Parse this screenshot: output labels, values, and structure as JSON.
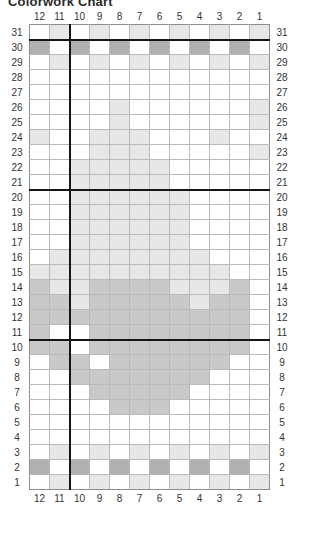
{
  "title": "Colorwork Chart",
  "legend_note": "",
  "colors": {
    "blank": "#ffffff",
    "light": "#e7e7e7",
    "mid": "#c9c9c9",
    "dark": "#b0b0b0",
    "grid": "#b9b9b9",
    "heavy": "#151515"
  },
  "chart_data": {
    "type": "heatmap",
    "title": "Colorwork Chart",
    "xlabel": "",
    "ylabel": "",
    "grid": true,
    "legend_position": "none",
    "columns": 12,
    "rows": 31,
    "column_labels_top": [
      "12",
      "11",
      "10",
      "9",
      "8",
      "7",
      "6",
      "5",
      "4",
      "3",
      "2",
      "1"
    ],
    "column_labels_bottom": [
      "12",
      "11",
      "10",
      "9",
      "8",
      "7",
      "6",
      "5",
      "4",
      "3",
      "2",
      "1"
    ],
    "row_labels_left": [
      "31",
      "30",
      "29",
      "28",
      "27",
      "26",
      "25",
      "24",
      "23",
      "22",
      "21",
      "20",
      "19",
      "18",
      "17",
      "16",
      "15",
      "14",
      "13",
      "12",
      "11",
      "10",
      "9",
      "8",
      "7",
      "6",
      "5",
      "4",
      "3",
      "2",
      "1"
    ],
    "row_labels_right": [
      "31",
      "30",
      "29",
      "28",
      "27",
      "26",
      "25",
      "24",
      "23",
      "22",
      "21",
      "20",
      "19",
      "18",
      "17",
      "16",
      "15",
      "14",
      "13",
      "12",
      "11",
      "10",
      "9",
      "8",
      "7",
      "6",
      "5",
      "4",
      "3",
      "2",
      "1"
    ],
    "value_legend": {
      "0": "blank",
      "1": "light",
      "2": "mid",
      "3": "dark"
    },
    "heavy_vertical_after_column_index": 2,
    "heavy_horizontal_after_rows": [
      "31",
      "21",
      "11"
    ],
    "matrix": [
      [
        0,
        1,
        0,
        1,
        0,
        1,
        0,
        1,
        0,
        1,
        0,
        1
      ],
      [
        3,
        0,
        3,
        0,
        3,
        0,
        3,
        0,
        3,
        0,
        3,
        0
      ],
      [
        0,
        1,
        0,
        1,
        0,
        1,
        0,
        1,
        0,
        1,
        0,
        1
      ],
      [
        0,
        0,
        0,
        0,
        0,
        0,
        0,
        0,
        0,
        0,
        0,
        0
      ],
      [
        0,
        0,
        0,
        0,
        0,
        0,
        0,
        0,
        0,
        0,
        0,
        0
      ],
      [
        0,
        0,
        0,
        0,
        1,
        0,
        0,
        0,
        0,
        0,
        0,
        1
      ],
      [
        0,
        0,
        0,
        0,
        1,
        0,
        0,
        0,
        0,
        0,
        0,
        1
      ],
      [
        1,
        0,
        0,
        1,
        1,
        1,
        0,
        0,
        0,
        1,
        0,
        0
      ],
      [
        0,
        0,
        0,
        1,
        1,
        1,
        0,
        0,
        0,
        0,
        0,
        1
      ],
      [
        0,
        0,
        1,
        1,
        1,
        1,
        1,
        0,
        0,
        0,
        0,
        0
      ],
      [
        0,
        0,
        1,
        1,
        1,
        1,
        1,
        0,
        0,
        0,
        0,
        0
      ],
      [
        0,
        0,
        1,
        1,
        1,
        1,
        1,
        1,
        0,
        0,
        0,
        0
      ],
      [
        0,
        0,
        1,
        1,
        1,
        1,
        1,
        1,
        0,
        0,
        0,
        0
      ],
      [
        0,
        0,
        1,
        1,
        1,
        1,
        1,
        1,
        0,
        0,
        0,
        0
      ],
      [
        0,
        0,
        1,
        1,
        1,
        1,
        1,
        1,
        0,
        0,
        0,
        0
      ],
      [
        0,
        1,
        1,
        1,
        1,
        1,
        1,
        1,
        1,
        0,
        0,
        0
      ],
      [
        1,
        1,
        1,
        1,
        1,
        1,
        1,
        1,
        1,
        1,
        0,
        0
      ],
      [
        2,
        1,
        1,
        2,
        2,
        2,
        2,
        1,
        1,
        1,
        2,
        0
      ],
      [
        2,
        2,
        1,
        2,
        2,
        2,
        2,
        2,
        1,
        2,
        2,
        0
      ],
      [
        2,
        2,
        2,
        2,
        2,
        2,
        2,
        2,
        2,
        2,
        2,
        0
      ],
      [
        2,
        0,
        0,
        2,
        2,
        2,
        2,
        2,
        2,
        2,
        2,
        0
      ],
      [
        2,
        2,
        0,
        2,
        2,
        2,
        2,
        2,
        2,
        2,
        2,
        0
      ],
      [
        0,
        2,
        2,
        0,
        2,
        2,
        2,
        2,
        2,
        2,
        0,
        0
      ],
      [
        0,
        0,
        2,
        2,
        2,
        2,
        2,
        2,
        2,
        0,
        0,
        0
      ],
      [
        0,
        0,
        0,
        2,
        2,
        2,
        2,
        2,
        0,
        0,
        0,
        0
      ],
      [
        0,
        0,
        0,
        0,
        2,
        2,
        2,
        0,
        0,
        0,
        0,
        0
      ],
      [
        0,
        0,
        0,
        0,
        0,
        0,
        0,
        0,
        0,
        0,
        0,
        0
      ],
      [
        0,
        0,
        0,
        0,
        0,
        0,
        0,
        0,
        0,
        0,
        0,
        0
      ],
      [
        0,
        1,
        0,
        1,
        0,
        1,
        0,
        1,
        0,
        1,
        0,
        1
      ],
      [
        3,
        0,
        3,
        0,
        3,
        0,
        3,
        0,
        3,
        0,
        3,
        0
      ],
      [
        0,
        1,
        0,
        1,
        0,
        1,
        0,
        1,
        0,
        1,
        0,
        1
      ]
    ]
  }
}
